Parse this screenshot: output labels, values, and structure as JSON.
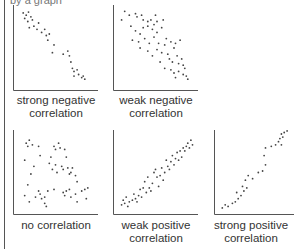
{
  "page": {
    "top_clipped_text": "by a graph"
  },
  "chart_data": [
    {
      "type": "scatter",
      "title": "strong negative correlation",
      "caption_lines": [
        "strong negative",
        "correlation"
      ],
      "xlabel": "",
      "ylabel": "",
      "grid": false,
      "xlim": [
        0,
        100
      ],
      "ylim": [
        0,
        100
      ],
      "points": [
        [
          8,
          95
        ],
        [
          12,
          92
        ],
        [
          15,
          96
        ],
        [
          10,
          88
        ],
        [
          18,
          90
        ],
        [
          14,
          84
        ],
        [
          20,
          86
        ],
        [
          22,
          78
        ],
        [
          16,
          76
        ],
        [
          28,
          82
        ],
        [
          26,
          74
        ],
        [
          32,
          70
        ],
        [
          36,
          74
        ],
        [
          38,
          66
        ],
        [
          42,
          68
        ],
        [
          40,
          60
        ],
        [
          48,
          54
        ],
        [
          46,
          44
        ],
        [
          60,
          42
        ],
        [
          66,
          46
        ],
        [
          68,
          40
        ],
        [
          70,
          32
        ],
        [
          72,
          24
        ],
        [
          74,
          20
        ],
        [
          78,
          22
        ],
        [
          80,
          16
        ],
        [
          74,
          14
        ],
        [
          84,
          12
        ],
        [
          86,
          14
        ],
        [
          88,
          10
        ]
      ]
    },
    {
      "type": "scatter",
      "title": "weak negative correlation",
      "caption_lines": [
        "weak negative",
        "correlation"
      ],
      "xlabel": "",
      "ylabel": "",
      "grid": false,
      "xlim": [
        0,
        100
      ],
      "ylim": [
        0,
        100
      ],
      "points": [
        [
          10,
          97
        ],
        [
          6,
          86
        ],
        [
          16,
          92
        ],
        [
          24,
          94
        ],
        [
          26,
          90
        ],
        [
          32,
          92
        ],
        [
          34,
          86
        ],
        [
          40,
          84
        ],
        [
          44,
          86
        ],
        [
          50,
          92
        ],
        [
          52,
          84
        ],
        [
          60,
          86
        ],
        [
          18,
          78
        ],
        [
          24,
          72
        ],
        [
          30,
          68
        ],
        [
          34,
          76
        ],
        [
          40,
          78
        ],
        [
          46,
          74
        ],
        [
          48,
          80
        ],
        [
          52,
          70
        ],
        [
          58,
          76
        ],
        [
          20,
          60
        ],
        [
          28,
          58
        ],
        [
          30,
          50
        ],
        [
          36,
          62
        ],
        [
          42,
          56
        ],
        [
          48,
          64
        ],
        [
          54,
          56
        ],
        [
          62,
          54
        ],
        [
          64,
          62
        ],
        [
          70,
          58
        ],
        [
          74,
          50
        ],
        [
          76,
          56
        ],
        [
          82,
          60
        ],
        [
          40,
          46
        ],
        [
          46,
          40
        ],
        [
          52,
          48
        ],
        [
          58,
          44
        ],
        [
          66,
          42
        ],
        [
          68,
          36
        ],
        [
          72,
          32
        ],
        [
          78,
          40
        ],
        [
          80,
          30
        ],
        [
          84,
          36
        ],
        [
          86,
          28
        ],
        [
          56,
          32
        ],
        [
          62,
          24
        ],
        [
          70,
          22
        ],
        [
          74,
          18
        ],
        [
          80,
          20
        ],
        [
          86,
          16
        ],
        [
          88,
          24
        ],
        [
          90,
          14
        ],
        [
          92,
          10
        ],
        [
          76,
          12
        ]
      ]
    },
    {
      "type": "scatter",
      "title": "no correlation",
      "caption_lines": [
        "no correlation"
      ],
      "xlabel": "",
      "ylabel": "",
      "grid": false,
      "xlim": [
        0,
        100
      ],
      "ylim": [
        0,
        100
      ],
      "points": [
        [
          12,
          88
        ],
        [
          14,
          84
        ],
        [
          16,
          92
        ],
        [
          20,
          86
        ],
        [
          28,
          84
        ],
        [
          30,
          72
        ],
        [
          10,
          66
        ],
        [
          18,
          48
        ],
        [
          22,
          58
        ],
        [
          14,
          34
        ],
        [
          10,
          20
        ],
        [
          16,
          12
        ],
        [
          24,
          18
        ],
        [
          28,
          26
        ],
        [
          30,
          22
        ],
        [
          32,
          16
        ],
        [
          36,
          18
        ],
        [
          36,
          10
        ],
        [
          38,
          6
        ],
        [
          40,
          26
        ],
        [
          44,
          70
        ],
        [
          42,
          62
        ],
        [
          46,
          54
        ],
        [
          48,
          84
        ],
        [
          50,
          80
        ],
        [
          54,
          88
        ],
        [
          56,
          82
        ],
        [
          50,
          60
        ],
        [
          52,
          50
        ],
        [
          58,
          58
        ],
        [
          62,
          80
        ],
        [
          64,
          70
        ],
        [
          60,
          54
        ],
        [
          66,
          56
        ],
        [
          68,
          48
        ],
        [
          72,
          56
        ],
        [
          70,
          50
        ],
        [
          76,
          46
        ],
        [
          78,
          38
        ],
        [
          76,
          22
        ],
        [
          78,
          12
        ],
        [
          60,
          24
        ],
        [
          62,
          20
        ],
        [
          64,
          26
        ],
        [
          68,
          28
        ],
        [
          70,
          18
        ],
        [
          84,
          26
        ],
        [
          88,
          28
        ],
        [
          90,
          16
        ],
        [
          92,
          30
        ],
        [
          48,
          28
        ]
      ]
    },
    {
      "type": "scatter",
      "title": "weak positive correlation",
      "caption_lines": [
        "weak positive",
        "correlation"
      ],
      "xlabel": "",
      "ylabel": "",
      "grid": false,
      "xlim": [
        0,
        100
      ],
      "ylim": [
        0,
        100
      ],
      "points": [
        [
          6,
          8
        ],
        [
          8,
          14
        ],
        [
          10,
          10
        ],
        [
          12,
          18
        ],
        [
          14,
          6
        ],
        [
          16,
          12
        ],
        [
          20,
          14
        ],
        [
          22,
          22
        ],
        [
          24,
          16
        ],
        [
          26,
          12
        ],
        [
          28,
          20
        ],
        [
          30,
          28
        ],
        [
          32,
          18
        ],
        [
          34,
          30
        ],
        [
          36,
          38
        ],
        [
          38,
          24
        ],
        [
          40,
          44
        ],
        [
          42,
          30
        ],
        [
          44,
          26
        ],
        [
          46,
          36
        ],
        [
          48,
          50
        ],
        [
          50,
          54
        ],
        [
          52,
          44
        ],
        [
          54,
          32
        ],
        [
          56,
          46
        ],
        [
          58,
          56
        ],
        [
          60,
          40
        ],
        [
          62,
          50
        ],
        [
          64,
          66
        ],
        [
          66,
          58
        ],
        [
          68,
          54
        ],
        [
          70,
          64
        ],
        [
          72,
          72
        ],
        [
          74,
          60
        ],
        [
          76,
          68
        ],
        [
          78,
          76
        ],
        [
          80,
          66
        ],
        [
          82,
          78
        ],
        [
          84,
          70
        ],
        [
          86,
          82
        ],
        [
          88,
          78
        ],
        [
          90,
          84
        ],
        [
          92,
          88
        ],
        [
          94,
          82
        ],
        [
          96,
          92
        ],
        [
          98,
          86
        ]
      ]
    },
    {
      "type": "scatter",
      "title": "strong positive correlation",
      "caption_lines": [
        "strong positive",
        "correlation"
      ],
      "xlabel": "",
      "ylabel": "",
      "grid": false,
      "xlim": [
        0,
        100
      ],
      "ylim": [
        0,
        100
      ],
      "points": [
        [
          6,
          4
        ],
        [
          10,
          8
        ],
        [
          14,
          6
        ],
        [
          20,
          10
        ],
        [
          24,
          12
        ],
        [
          26,
          24
        ],
        [
          28,
          16
        ],
        [
          32,
          20
        ],
        [
          34,
          32
        ],
        [
          36,
          26
        ],
        [
          38,
          40
        ],
        [
          40,
          30
        ],
        [
          42,
          46
        ],
        [
          48,
          42
        ],
        [
          56,
          50
        ],
        [
          62,
          52
        ],
        [
          64,
          72
        ],
        [
          66,
          60
        ],
        [
          66,
          82
        ],
        [
          74,
          84
        ],
        [
          80,
          86
        ],
        [
          84,
          90
        ],
        [
          86,
          94
        ],
        [
          88,
          86
        ],
        [
          90,
          96
        ],
        [
          92,
          102
        ],
        [
          96,
          104
        ],
        [
          88,
          100
        ]
      ]
    }
  ]
}
